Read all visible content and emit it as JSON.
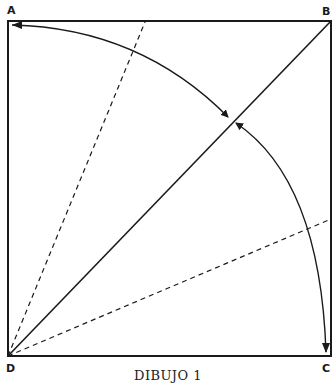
{
  "figure": {
    "caption": "DIBUJO 1",
    "vertices": {
      "A": "A",
      "B": "B",
      "C": "C",
      "D": "D"
    },
    "colors": {
      "stroke": "#1a1a1a",
      "background": "#ffffff"
    },
    "elements": [
      "square ABCD",
      "diagonal DB",
      "dashed line from D toward top edge",
      "dashed line from D toward right edge",
      "arc arrow from diagonal to A",
      "arc arrow from C to diagonal"
    ]
  }
}
